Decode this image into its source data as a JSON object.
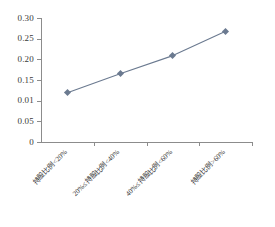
{
  "chart_data": {
    "type": "line",
    "title": "",
    "subtitle": "",
    "xlabel": "",
    "ylabel": "",
    "categories": [
      "持股比例<20%",
      "20%≤持股比例<40%",
      "40%≤持股比例<60%",
      "持股比例>60%"
    ],
    "values": [
      0.119,
      0.165,
      0.209,
      0.268
    ],
    "series": [
      {
        "name": "",
        "values": [
          0.119,
          0.165,
          0.209,
          0.268
        ]
      }
    ],
    "ylim": [
      0,
      0.3
    ],
    "ytick_labels": [
      "0.30",
      "0.25",
      "0.20",
      "0.15",
      "0.01",
      "0.05",
      "0"
    ],
    "ytick_values": [
      0.3,
      0.25,
      0.2,
      0.15,
      0.1,
      0.05,
      0
    ],
    "grid": false,
    "legend": "none",
    "marker": "diamond",
    "series_color": "#6b7a90",
    "axis_color": "#8c8c8c",
    "background": "#ffffff"
  }
}
